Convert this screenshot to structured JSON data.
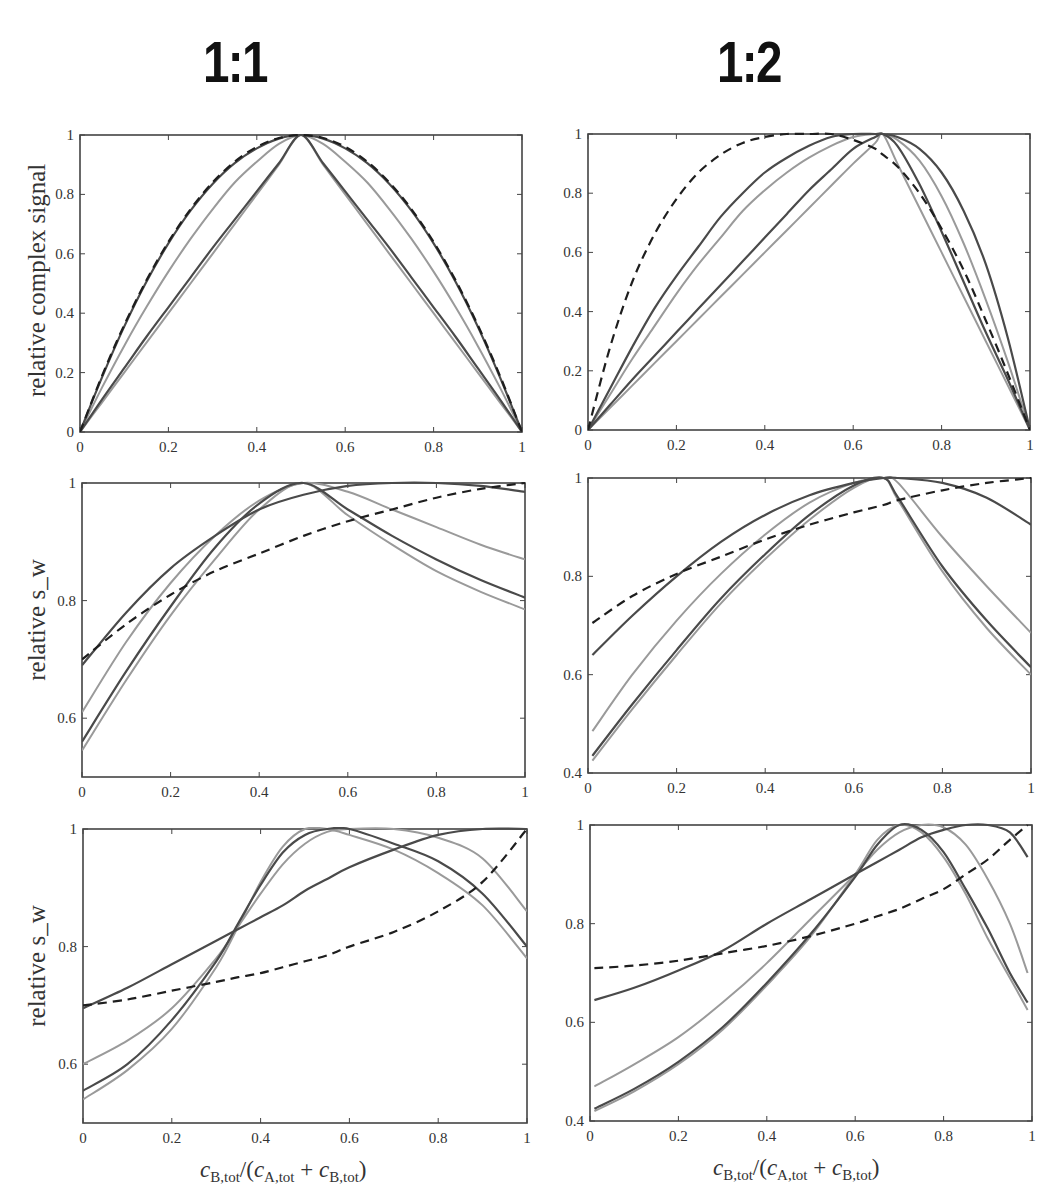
{
  "figure": {
    "column_titles": [
      "1:1",
      "1:2"
    ],
    "xlabel_parts": {
      "c1": "c",
      "s1": "B,tot",
      "mid": "/(",
      "c2": "c",
      "s2": "A,tot",
      "plus": " + ",
      "c3": "c",
      "s3": "B,tot",
      "end": ")"
    },
    "xlabel_text": "c_B,tot/(c_A,tot + c_B,tot)",
    "row_ylabels": [
      "relative complex signal",
      "relative s_w",
      "relative s_w"
    ],
    "colors": {
      "dark": "#4a4a4a",
      "light": "#9a9a9a",
      "dashed": "#1e1e1e",
      "axis": "#444444"
    }
  },
  "chart_data": [
    {
      "id": "top-left",
      "type": "line",
      "column": "1:1",
      "row": 0,
      "title": "",
      "xlabel": "",
      "ylabel": "relative complex signal",
      "xlim": [
        0,
        1
      ],
      "ylim": [
        0,
        1
      ],
      "xticks": [
        0,
        0.2,
        0.4,
        0.6,
        0.8,
        1
      ],
      "xticklabels": [
        "0",
        "0.2",
        "0.4",
        "0.6",
        "0.8",
        "1"
      ],
      "yticks": [
        0,
        0.2,
        0.4,
        0.6,
        0.8,
        1
      ],
      "yticklabels": [
        "0",
        "0.2",
        "0.4",
        "0.6",
        "0.8",
        "1"
      ],
      "box": {
        "x0": 80,
        "y0": 135,
        "x1": 522,
        "y1": 432
      },
      "x": [
        0,
        0.05,
        0.1,
        0.15,
        0.2,
        0.25,
        0.3,
        0.35,
        0.4,
        0.45,
        0.5,
        0.55,
        0.6,
        0.65,
        0.7,
        0.75,
        0.8,
        0.85,
        0.9,
        0.95,
        1
      ],
      "series": [
        {
          "name": "dashed",
          "style": "dashed",
          "values": [
            0,
            0.19,
            0.36,
            0.51,
            0.64,
            0.75,
            0.84,
            0.91,
            0.96,
            0.99,
            1,
            0.99,
            0.96,
            0.91,
            0.84,
            0.75,
            0.64,
            0.51,
            0.36,
            0.19,
            0
          ]
        },
        {
          "name": "dark-1",
          "style": "dark",
          "values": [
            0,
            0.185,
            0.355,
            0.505,
            0.635,
            0.745,
            0.835,
            0.905,
            0.955,
            0.988,
            1,
            0.988,
            0.955,
            0.905,
            0.835,
            0.745,
            0.635,
            0.505,
            0.355,
            0.185,
            0
          ]
        },
        {
          "name": "light-1",
          "style": "light",
          "values": [
            0,
            0.15,
            0.29,
            0.42,
            0.54,
            0.65,
            0.75,
            0.84,
            0.91,
            0.97,
            1,
            0.97,
            0.91,
            0.84,
            0.75,
            0.65,
            0.54,
            0.42,
            0.29,
            0.15,
            0
          ]
        },
        {
          "name": "dark-2",
          "style": "dark",
          "values": [
            0,
            0.11,
            0.215,
            0.32,
            0.42,
            0.52,
            0.62,
            0.715,
            0.81,
            0.905,
            1,
            0.905,
            0.81,
            0.715,
            0.62,
            0.52,
            0.42,
            0.32,
            0.215,
            0.11,
            0
          ]
        },
        {
          "name": "light-2",
          "style": "light",
          "values": [
            0,
            0.1,
            0.2,
            0.3,
            0.4,
            0.5,
            0.6,
            0.7,
            0.8,
            0.9,
            1,
            0.9,
            0.8,
            0.7,
            0.6,
            0.5,
            0.4,
            0.3,
            0.2,
            0.1,
            0
          ]
        }
      ]
    },
    {
      "id": "top-right",
      "type": "line",
      "column": "1:2",
      "row": 0,
      "title": "",
      "xlabel": "",
      "ylabel": "",
      "xlim": [
        0,
        1
      ],
      "ylim": [
        0,
        1
      ],
      "xticks": [
        0,
        0.2,
        0.4,
        0.6,
        0.8,
        1
      ],
      "xticklabels": [
        "0",
        "0.2",
        "0.4",
        "0.6",
        "0.8",
        "1"
      ],
      "yticks": [
        0,
        0.2,
        0.4,
        0.6,
        0.8,
        1
      ],
      "yticklabels": [
        "0",
        "0.2",
        "0.4",
        "0.6",
        "0.8",
        "1"
      ],
      "box": {
        "x0": 588,
        "y0": 134,
        "x1": 1030,
        "y1": 430
      },
      "x": [
        0,
        0.05,
        0.1,
        0.15,
        0.2,
        0.25,
        0.3,
        0.35,
        0.4,
        0.45,
        0.5,
        0.55,
        0.6,
        0.65,
        0.667,
        0.7,
        0.75,
        0.8,
        0.85,
        0.9,
        0.95,
        1
      ],
      "series": [
        {
          "name": "dashed",
          "style": "dashed",
          "values": [
            0,
            0.28,
            0.5,
            0.66,
            0.78,
            0.87,
            0.93,
            0.97,
            0.99,
            1,
            1,
            1,
            0.98,
            0.95,
            0.93,
            0.89,
            0.8,
            0.68,
            0.54,
            0.37,
            0.19,
            0
          ]
        },
        {
          "name": "dark-1",
          "style": "dark",
          "values": [
            0,
            0.14,
            0.28,
            0.41,
            0.52,
            0.62,
            0.72,
            0.8,
            0.87,
            0.92,
            0.96,
            0.99,
            1,
            1,
            1,
            0.99,
            0.95,
            0.87,
            0.74,
            0.56,
            0.31,
            0
          ]
        },
        {
          "name": "light-1",
          "style": "light",
          "values": [
            0,
            0.12,
            0.24,
            0.35,
            0.46,
            0.56,
            0.65,
            0.74,
            0.81,
            0.87,
            0.92,
            0.96,
            0.99,
            1,
            1,
            0.98,
            0.91,
            0.79,
            0.63,
            0.44,
            0.23,
            0
          ]
        },
        {
          "name": "dark-2",
          "style": "dark",
          "values": [
            0,
            0.085,
            0.17,
            0.25,
            0.33,
            0.41,
            0.49,
            0.57,
            0.65,
            0.73,
            0.81,
            0.88,
            0.95,
            0.99,
            1,
            0.96,
            0.83,
            0.67,
            0.5,
            0.33,
            0.17,
            0
          ]
        },
        {
          "name": "light-2",
          "style": "light",
          "values": [
            0,
            0.075,
            0.15,
            0.225,
            0.3,
            0.375,
            0.45,
            0.525,
            0.6,
            0.675,
            0.75,
            0.825,
            0.9,
            0.97,
            1,
            0.9,
            0.75,
            0.6,
            0.45,
            0.3,
            0.15,
            0
          ]
        }
      ]
    },
    {
      "id": "middle-left",
      "type": "line",
      "column": "1:1",
      "row": 1,
      "title": "",
      "xlabel": "",
      "ylabel": "relative s_w",
      "xlim": [
        0,
        1
      ],
      "ylim": [
        0.5,
        1
      ],
      "xticks": [
        0,
        0.2,
        0.4,
        0.6,
        0.8,
        1
      ],
      "xticklabels": [
        "0",
        "0.2",
        "0.4",
        "0.6",
        "0.8",
        "1"
      ],
      "yticks": [
        0.6,
        0.8,
        1
      ],
      "yticklabels": [
        "0.6",
        "0.8",
        "1"
      ],
      "box": {
        "x0": 82,
        "y0": 483,
        "x1": 525,
        "y1": 777
      },
      "x": [
        0,
        0.1,
        0.2,
        0.3,
        0.4,
        0.5,
        0.6,
        0.7,
        0.8,
        0.9,
        1
      ],
      "series": [
        {
          "name": "dashed",
          "style": "dashed",
          "values": [
            0.7,
            0.76,
            0.81,
            0.85,
            0.88,
            0.91,
            0.935,
            0.955,
            0.975,
            0.99,
            1.0
          ]
        },
        {
          "name": "dark-1",
          "style": "dark",
          "values": [
            0.69,
            0.78,
            0.855,
            0.91,
            0.955,
            0.98,
            0.995,
            1.0,
            1.0,
            0.995,
            0.985
          ]
        },
        {
          "name": "light-1",
          "style": "light",
          "values": [
            0.61,
            0.73,
            0.83,
            0.91,
            0.97,
            1.0,
            0.985,
            0.955,
            0.925,
            0.895,
            0.87
          ]
        },
        {
          "name": "dark-2",
          "style": "dark",
          "values": [
            0.56,
            0.68,
            0.79,
            0.89,
            0.965,
            1.0,
            0.955,
            0.91,
            0.87,
            0.835,
            0.805
          ]
        },
        {
          "name": "light-2",
          "style": "light",
          "values": [
            0.545,
            0.665,
            0.775,
            0.87,
            0.955,
            1.0,
            0.945,
            0.895,
            0.85,
            0.815,
            0.785
          ]
        }
      ]
    },
    {
      "id": "middle-right",
      "type": "line",
      "column": "1:2",
      "row": 1,
      "title": "",
      "xlabel": "",
      "ylabel": "",
      "xlim": [
        0,
        1
      ],
      "ylim": [
        0.4,
        1
      ],
      "xticks": [
        0,
        0.2,
        0.4,
        0.6,
        0.8,
        1
      ],
      "xticklabels": [
        "0",
        "0.2",
        "0.4",
        "0.6",
        "0.8",
        "1"
      ],
      "yticks": [
        0.4,
        0.6,
        0.8,
        1
      ],
      "yticklabels": [
        "0.4",
        "0.6",
        "0.8",
        "1"
      ],
      "box": {
        "x0": 588,
        "y0": 478,
        "x1": 1031,
        "y1": 773
      },
      "x": [
        0.01,
        0.1,
        0.2,
        0.3,
        0.4,
        0.5,
        0.6,
        0.667,
        0.7,
        0.8,
        0.9,
        1
      ],
      "series": [
        {
          "name": "dashed",
          "style": "dashed",
          "values": [
            0.705,
            0.76,
            0.805,
            0.84,
            0.875,
            0.905,
            0.93,
            0.945,
            0.955,
            0.975,
            0.99,
            1.0
          ]
        },
        {
          "name": "dark-1",
          "style": "dark",
          "values": [
            0.64,
            0.72,
            0.8,
            0.87,
            0.925,
            0.965,
            0.99,
            1.0,
            1.0,
            0.99,
            0.96,
            0.905
          ]
        },
        {
          "name": "light-1",
          "style": "light",
          "values": [
            0.485,
            0.6,
            0.71,
            0.805,
            0.885,
            0.95,
            0.99,
            1.0,
            0.99,
            0.88,
            0.78,
            0.685
          ]
        },
        {
          "name": "dark-2",
          "style": "dark",
          "values": [
            0.435,
            0.54,
            0.65,
            0.755,
            0.845,
            0.925,
            0.985,
            1.0,
            0.96,
            0.82,
            0.71,
            0.615
          ]
        },
        {
          "name": "light-2",
          "style": "light",
          "values": [
            0.425,
            0.53,
            0.64,
            0.745,
            0.835,
            0.915,
            0.98,
            1.0,
            0.955,
            0.81,
            0.695,
            0.6
          ]
        }
      ]
    },
    {
      "id": "bottom-left",
      "type": "line",
      "column": "1:1",
      "row": 2,
      "title": "",
      "xlabel": "c_B,tot/(c_A,tot + c_B,tot)",
      "ylabel": "relative s_w",
      "xlim": [
        0,
        1
      ],
      "ylim": [
        0.5,
        1
      ],
      "xticks": [
        0,
        0.2,
        0.4,
        0.6,
        0.8,
        1
      ],
      "xticklabels": [
        "0",
        "0.2",
        "0.4",
        "0.6",
        "0.8",
        "1"
      ],
      "yticks": [
        0.6,
        0.8,
        1
      ],
      "yticklabels": [
        "0.6",
        "0.8",
        "1"
      ],
      "box": {
        "x0": 83,
        "y0": 829,
        "x1": 527,
        "y1": 1123
      },
      "x": [
        0,
        0.1,
        0.2,
        0.3,
        0.35,
        0.4,
        0.45,
        0.5,
        0.55,
        0.6,
        0.7,
        0.8,
        0.9,
        1
      ],
      "series": [
        {
          "name": "dashed",
          "style": "dashed",
          "values": [
            0.7,
            0.71,
            0.725,
            0.74,
            0.748,
            0.755,
            0.765,
            0.775,
            0.785,
            0.8,
            0.825,
            0.86,
            0.91,
            1.0
          ]
        },
        {
          "name": "dark-1",
          "style": "dark",
          "values": [
            0.695,
            0.73,
            0.77,
            0.81,
            0.83,
            0.85,
            0.87,
            0.895,
            0.915,
            0.935,
            0.965,
            0.99,
            1.0,
            1.0
          ]
        },
        {
          "name": "light-1",
          "style": "light",
          "values": [
            0.6,
            0.64,
            0.695,
            0.78,
            0.835,
            0.89,
            0.94,
            0.975,
            0.995,
            1.0,
            1.0,
            0.985,
            0.95,
            0.86
          ]
        },
        {
          "name": "dark-2",
          "style": "dark",
          "values": [
            0.555,
            0.6,
            0.675,
            0.775,
            0.84,
            0.905,
            0.96,
            0.99,
            1.0,
            1.0,
            0.975,
            0.945,
            0.89,
            0.8
          ]
        },
        {
          "name": "light-2",
          "style": "light",
          "values": [
            0.54,
            0.59,
            0.66,
            0.765,
            0.835,
            0.91,
            0.97,
            1.0,
            1.0,
            0.99,
            0.965,
            0.925,
            0.87,
            0.78
          ]
        }
      ]
    },
    {
      "id": "bottom-right",
      "type": "line",
      "column": "1:2",
      "row": 2,
      "title": "",
      "xlabel": "c_B,tot/(c_A,tot + c_B,tot)",
      "ylabel": "",
      "xlim": [
        0,
        1
      ],
      "ylim": [
        0.4,
        1
      ],
      "xticks": [
        0,
        0.2,
        0.4,
        0.6,
        0.8,
        1
      ],
      "xticklabels": [
        "0",
        "0.2",
        "0.4",
        "0.6",
        "0.8",
        "1"
      ],
      "yticks": [
        0.4,
        0.6,
        0.8,
        1
      ],
      "yticklabels": [
        "0.4",
        "0.6",
        "0.8",
        "1"
      ],
      "box": {
        "x0": 590,
        "y0": 825,
        "x1": 1032,
        "y1": 1121
      },
      "x": [
        0.01,
        0.1,
        0.2,
        0.3,
        0.4,
        0.5,
        0.6,
        0.65,
        0.7,
        0.75,
        0.8,
        0.85,
        0.9,
        0.95,
        0.99
      ],
      "series": [
        {
          "name": "dashed",
          "style": "dashed",
          "values": [
            0.71,
            0.715,
            0.725,
            0.74,
            0.755,
            0.775,
            0.8,
            0.815,
            0.83,
            0.85,
            0.87,
            0.9,
            0.93,
            0.97,
            1.0
          ]
        },
        {
          "name": "dark-1",
          "style": "dark",
          "values": [
            0.645,
            0.67,
            0.705,
            0.745,
            0.8,
            0.85,
            0.9,
            0.925,
            0.95,
            0.975,
            0.99,
            1.0,
            1.0,
            0.985,
            0.935
          ]
        },
        {
          "name": "light-1",
          "style": "light",
          "values": [
            0.47,
            0.515,
            0.57,
            0.64,
            0.72,
            0.81,
            0.9,
            0.95,
            0.985,
            1.0,
            0.995,
            0.96,
            0.89,
            0.8,
            0.7
          ]
        },
        {
          "name": "dark-2",
          "style": "dark",
          "values": [
            0.425,
            0.465,
            0.52,
            0.59,
            0.68,
            0.78,
            0.895,
            0.96,
            1.0,
            0.99,
            0.945,
            0.87,
            0.79,
            0.7,
            0.64
          ]
        },
        {
          "name": "light-2",
          "style": "light",
          "values": [
            0.42,
            0.46,
            0.515,
            0.585,
            0.675,
            0.775,
            0.9,
            0.97,
            1.0,
            0.985,
            0.935,
            0.86,
            0.77,
            0.69,
            0.625
          ]
        }
      ]
    }
  ]
}
